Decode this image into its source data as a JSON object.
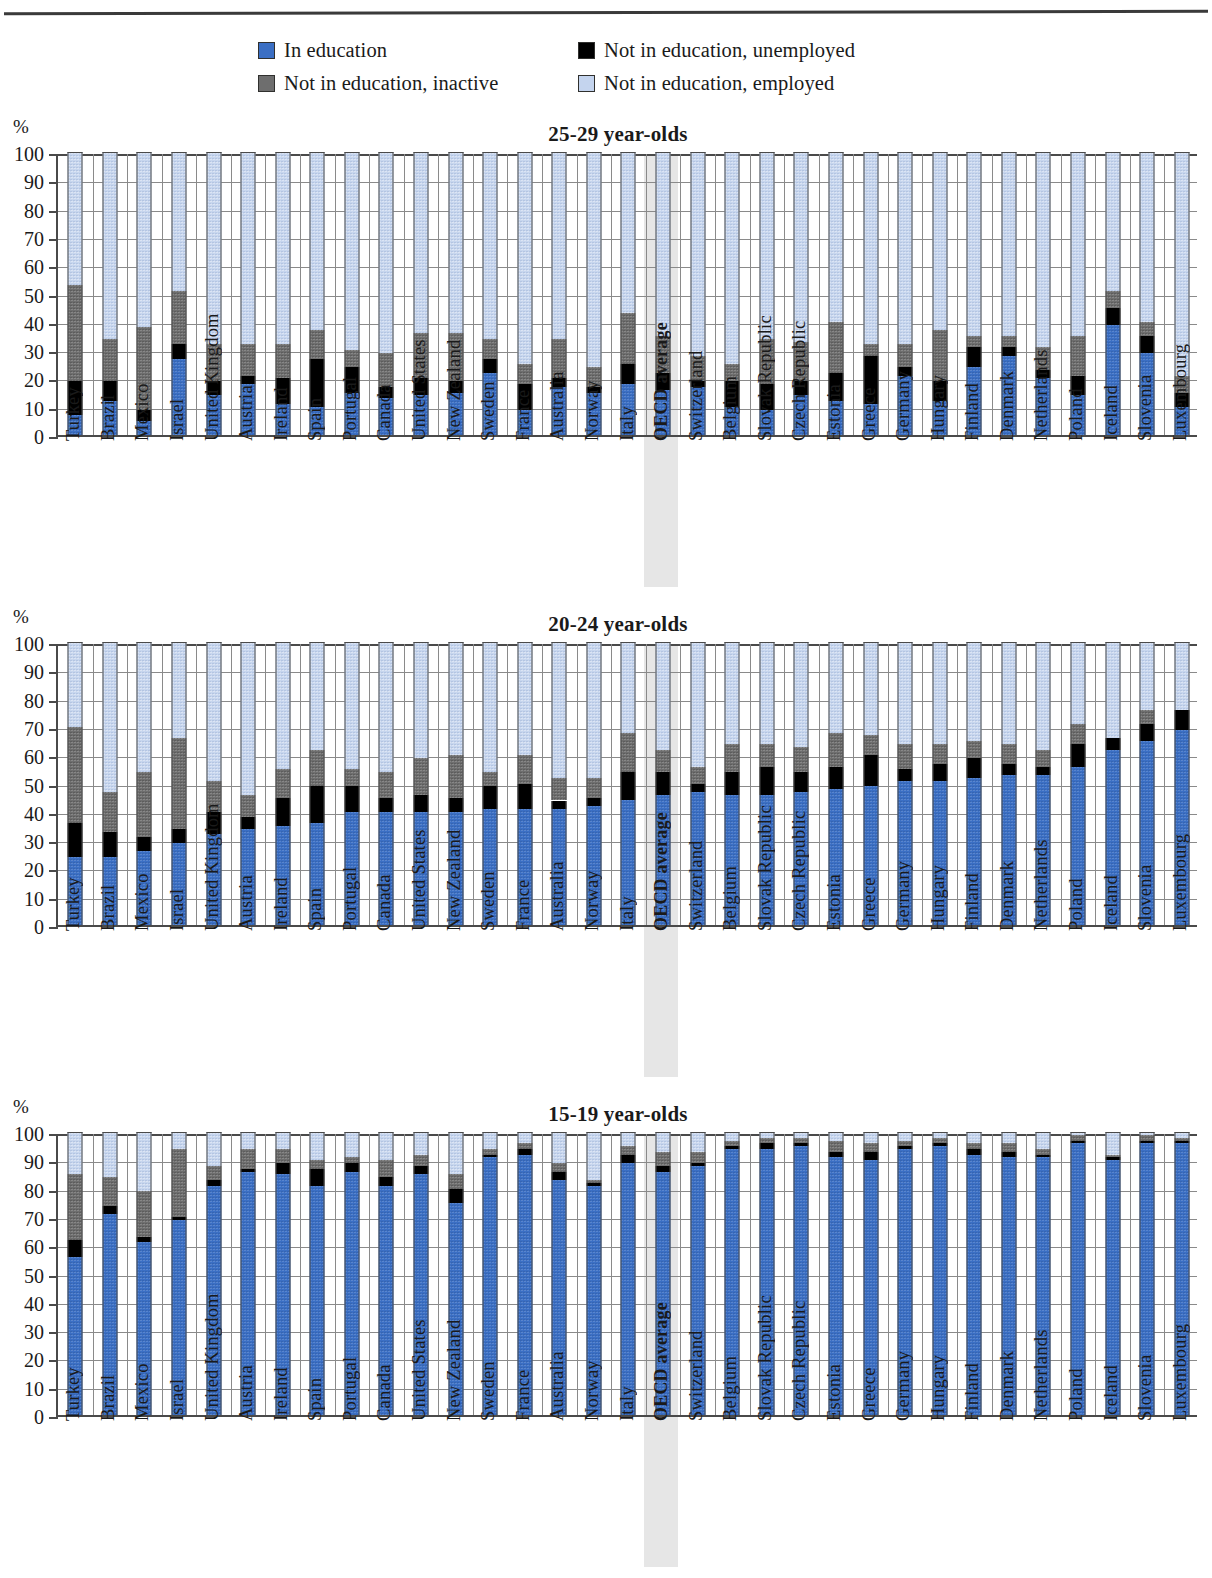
{
  "legend": {
    "items": [
      {
        "label": "In education",
        "icon": "square-swatch-blue",
        "color": "#3b6fc4",
        "key": "in_education"
      },
      {
        "label": "Not in education, unemployed",
        "icon": "square-swatch-black",
        "color": "#000000",
        "key": "unemployed"
      },
      {
        "label": "Not in education, inactive",
        "icon": "square-swatch-gray",
        "color": "#6e6e6e",
        "key": "inactive"
      },
      {
        "label": "Not in education, employed",
        "icon": "square-swatch-lightblue",
        "color": "#c4d4ee",
        "key": "employed"
      }
    ]
  },
  "axis": {
    "unit": "%",
    "ticks": [
      "100",
      "90",
      "80",
      "70",
      "60",
      "50",
      "40",
      "30",
      "20",
      "10",
      "0"
    ]
  },
  "countries": [
    "Turkey",
    "Brazil",
    "Mexico",
    "Israel",
    "United Kingdom",
    "Austria",
    "Ireland",
    "Spain",
    "Portugal",
    "Canada",
    "United States",
    "New Zealand",
    "Sweden",
    "France",
    "Australia",
    "Norway",
    "Italy",
    "OECD average",
    "Switzerland",
    "Belgium",
    "Slovak Republic",
    "Czech Republic",
    "Estonia",
    "Greece",
    "Germany",
    "Hungary",
    "Finland",
    "Denmark",
    "Netherlands",
    "Poland",
    "Iceland",
    "Slovenia",
    "Luxembourg"
  ],
  "highlight_category": "OECD average",
  "chart_data": [
    {
      "type": "bar",
      "title": "25-29 year-olds",
      "stacked": true,
      "xlabel": "",
      "ylabel": "%",
      "ylim": [
        0,
        100
      ],
      "grid": true,
      "legend_position": "top",
      "categories": [
        "Turkey",
        "Brazil",
        "Mexico",
        "Israel",
        "United Kingdom",
        "Austria",
        "Ireland",
        "Spain",
        "Portugal",
        "Canada",
        "United States",
        "New Zealand",
        "Sweden",
        "France",
        "Australia",
        "Norway",
        "Italy",
        "OECD average",
        "Switzerland",
        "Belgium",
        "Slovak Republic",
        "Czech Republic",
        "Estonia",
        "Greece",
        "Germany",
        "Hungary",
        "Finland",
        "Denmark",
        "Netherlands",
        "Poland",
        "Iceland",
        "Slovenia",
        "Luxembourg"
      ],
      "series": [
        {
          "name": "In education",
          "values": [
            7,
            12,
            5,
            27,
            14,
            18,
            11,
            10,
            15,
            13,
            14,
            15,
            22,
            9,
            17,
            15,
            18,
            16,
            17,
            10,
            9,
            14,
            12,
            11,
            21,
            12,
            24,
            28,
            20,
            14,
            39,
            29,
            10
          ]
        },
        {
          "name": "Not in education, unemployed",
          "values": [
            12,
            7,
            4,
            5,
            5,
            3,
            9,
            17,
            9,
            4,
            6,
            4,
            5,
            9,
            3,
            2,
            7,
            6,
            2,
            9,
            9,
            5,
            10,
            17,
            3,
            7,
            7,
            3,
            3,
            7,
            6,
            6,
            5
          ]
        },
        {
          "name": "Not in education, inactive",
          "values": [
            34,
            15,
            29,
            19,
            13,
            11,
            12,
            10,
            6,
            12,
            16,
            17,
            7,
            7,
            14,
            7,
            18,
            13,
            9,
            6,
            16,
            14,
            18,
            4,
            8,
            18,
            4,
            4,
            8,
            14,
            6,
            5,
            6
          ]
        },
        {
          "name": "Not in education, employed",
          "values": [
            47,
            66,
            62,
            49,
            68,
            68,
            68,
            63,
            70,
            71,
            64,
            64,
            66,
            75,
            66,
            76,
            57,
            65,
            72,
            75,
            66,
            67,
            60,
            68,
            68,
            63,
            65,
            65,
            69,
            65,
            49,
            60,
            79
          ]
        }
      ]
    },
    {
      "type": "bar",
      "title": "20-24 year-olds",
      "stacked": true,
      "xlabel": "",
      "ylabel": "%",
      "ylim": [
        0,
        100
      ],
      "grid": true,
      "legend_position": "top",
      "categories": [
        "Turkey",
        "Brazil",
        "Mexico",
        "Israel",
        "United Kingdom",
        "Austria",
        "Ireland",
        "Spain",
        "Portugal",
        "Canada",
        "United States",
        "New Zealand",
        "Sweden",
        "France",
        "Australia",
        "Norway",
        "Italy",
        "OECD average",
        "Switzerland",
        "Belgium",
        "Slovak Republic",
        "Czech Republic",
        "Estonia",
        "Greece",
        "Germany",
        "Hungary",
        "Finland",
        "Denmark",
        "Netherlands",
        "Poland",
        "Iceland",
        "Slovenia",
        "Luxembourg"
      ],
      "series": [
        {
          "name": "In education",
          "values": [
            24,
            24,
            26,
            29,
            32,
            34,
            35,
            36,
            40,
            40,
            40,
            40,
            41,
            41,
            41,
            42,
            44,
            46,
            47,
            46,
            46,
            47,
            48,
            49,
            51,
            51,
            52,
            53,
            53,
            56,
            62,
            65,
            69
          ]
        },
        {
          "name": "Not in education, unemployed",
          "values": [
            12,
            9,
            5,
            5,
            8,
            4,
            10,
            13,
            9,
            5,
            6,
            5,
            8,
            9,
            3,
            3,
            10,
            8,
            3,
            8,
            10,
            7,
            8,
            11,
            4,
            6,
            7,
            4,
            3,
            8,
            4,
            6,
            7
          ]
        },
        {
          "name": "Not in education, inactive",
          "values": [
            34,
            14,
            23,
            32,
            11,
            8,
            10,
            13,
            6,
            9,
            13,
            15,
            5,
            10,
            8,
            7,
            14,
            8,
            6,
            10,
            8,
            9,
            12,
            7,
            9,
            7,
            6,
            7,
            6,
            7,
            0,
            5,
            0
          ]
        },
        {
          "name": "Not in education, employed",
          "values": [
            30,
            53,
            46,
            34,
            49,
            54,
            45,
            38,
            45,
            46,
            41,
            40,
            46,
            40,
            48,
            48,
            32,
            38,
            44,
            36,
            36,
            37,
            32,
            33,
            36,
            36,
            35,
            36,
            38,
            29,
            34,
            24,
            24
          ]
        }
      ]
    },
    {
      "type": "bar",
      "title": "15-19 year-olds",
      "stacked": true,
      "xlabel": "",
      "ylabel": "%",
      "ylim": [
        0,
        100
      ],
      "grid": true,
      "legend_position": "top",
      "categories": [
        "Turkey",
        "Brazil",
        "Mexico",
        "Israel",
        "United Kingdom",
        "Austria",
        "Ireland",
        "Spain",
        "Portugal",
        "Canada",
        "United States",
        "New Zealand",
        "Sweden",
        "France",
        "Australia",
        "Norway",
        "Italy",
        "OECD average",
        "Switzerland",
        "Belgium",
        "Slovak Republic",
        "Czech Republic",
        "Estonia",
        "Greece",
        "Germany",
        "Hungary",
        "Finland",
        "Denmark",
        "Netherlands",
        "Poland",
        "Iceland",
        "Slovenia",
        "Luxembourg"
      ],
      "series": [
        {
          "name": "In education",
          "values": [
            56,
            71,
            61,
            69,
            81,
            86,
            85,
            81,
            86,
            81,
            85,
            75,
            91,
            92,
            83,
            81,
            89,
            86,
            88,
            94,
            94,
            95,
            91,
            90,
            94,
            95,
            92,
            91,
            91,
            96,
            90,
            96,
            96
          ]
        },
        {
          "name": "Not in education, unemployed",
          "values": [
            6,
            3,
            2,
            1,
            2,
            1,
            4,
            6,
            3,
            3,
            3,
            5,
            1,
            2,
            3,
            1,
            3,
            2,
            1,
            1,
            2,
            1,
            2,
            3,
            1,
            1,
            2,
            2,
            1,
            1,
            1,
            1,
            1
          ]
        },
        {
          "name": "Not in education, inactive",
          "values": [
            23,
            10,
            16,
            24,
            5,
            7,
            5,
            3,
            2,
            6,
            4,
            5,
            2,
            2,
            3,
            1,
            3,
            5,
            4,
            2,
            2,
            2,
            4,
            3,
            2,
            2,
            2,
            3,
            2,
            2,
            1,
            2,
            1
          ]
        },
        {
          "name": "Not in education, employed",
          "values": [
            15,
            16,
            21,
            6,
            12,
            6,
            6,
            10,
            9,
            10,
            8,
            15,
            6,
            4,
            11,
            17,
            5,
            7,
            7,
            3,
            2,
            2,
            3,
            4,
            3,
            2,
            4,
            4,
            6,
            1,
            8,
            1,
            2
          ]
        }
      ]
    }
  ]
}
